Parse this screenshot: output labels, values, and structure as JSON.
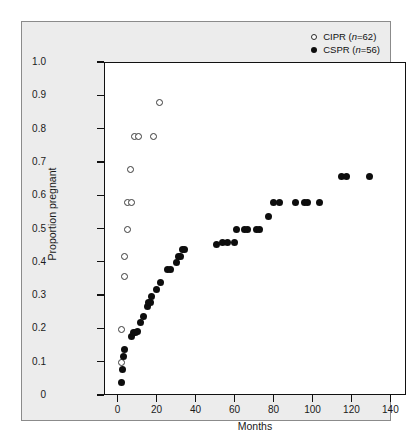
{
  "figure": {
    "background_color": "#ececec",
    "panel_border_color": "#8b8b8b",
    "plot_background": "#ffffff"
  },
  "chart_data": {
    "type": "scatter",
    "title": "",
    "xlabel": "Months",
    "ylabel": "Proportion pregnant",
    "xlim": [
      -7,
      148
    ],
    "ylim": [
      0,
      1.0
    ],
    "xticks": [
      0,
      20,
      40,
      60,
      80,
      100,
      120,
      140
    ],
    "xtick_labels": [
      "0",
      "20",
      "40",
      "60",
      "80",
      "100",
      "120",
      "140"
    ],
    "yticks": [
      0,
      0.1,
      0.2,
      0.3,
      0.4,
      0.5,
      0.6,
      0.7,
      0.8,
      0.9,
      1.0
    ],
    "ytick_labels": [
      "0",
      "0.1",
      "0.2",
      "0.3",
      "0.4",
      "0.5",
      "0.6",
      "0.7",
      "0.8",
      "0.9",
      "1.0"
    ],
    "grid": false,
    "legend_position": "top-right",
    "series": [
      {
        "name": "CIPR",
        "legend_label_main": "CIPR (",
        "legend_label_italic": "n",
        "legend_label_tail": "=62)",
        "n": 62,
        "marker": "open-circle",
        "marker_color": "#ffffff",
        "marker_edge_color": "#3a3a3a",
        "points": [
          {
            "x": 1.5,
            "y": 0.1
          },
          {
            "x": 1.5,
            "y": 0.2
          },
          {
            "x": 3.0,
            "y": 0.36
          },
          {
            "x": 3.0,
            "y": 0.42
          },
          {
            "x": 4.5,
            "y": 0.5
          },
          {
            "x": 4.5,
            "y": 0.58
          },
          {
            "x": 6.5,
            "y": 0.58
          },
          {
            "x": 6.0,
            "y": 0.68
          },
          {
            "x": 8.0,
            "y": 0.78
          },
          {
            "x": 10.0,
            "y": 0.78
          },
          {
            "x": 18.0,
            "y": 0.78
          },
          {
            "x": 21.0,
            "y": 0.88
          }
        ]
      },
      {
        "name": "CSPR",
        "legend_label_main": "CSPR (",
        "legend_label_italic": "n",
        "legend_label_tail": "=56)",
        "n": 56,
        "marker": "filled-circle",
        "marker_color": "#0d0d0d",
        "marker_edge_color": "#0d0d0d",
        "points": [
          {
            "x": 1.5,
            "y": 0.04
          },
          {
            "x": 2.0,
            "y": 0.08
          },
          {
            "x": 2.5,
            "y": 0.12
          },
          {
            "x": 3.0,
            "y": 0.14
          },
          {
            "x": 6.5,
            "y": 0.18
          },
          {
            "x": 7.5,
            "y": 0.19
          },
          {
            "x": 8.5,
            "y": 0.19
          },
          {
            "x": 9.5,
            "y": 0.195
          },
          {
            "x": 11.0,
            "y": 0.22
          },
          {
            "x": 13.0,
            "y": 0.24
          },
          {
            "x": 15.0,
            "y": 0.27
          },
          {
            "x": 15.5,
            "y": 0.28
          },
          {
            "x": 16.5,
            "y": 0.28
          },
          {
            "x": 17.0,
            "y": 0.3
          },
          {
            "x": 19.5,
            "y": 0.32
          },
          {
            "x": 21.5,
            "y": 0.34
          },
          {
            "x": 25.0,
            "y": 0.38
          },
          {
            "x": 26.5,
            "y": 0.38
          },
          {
            "x": 29.5,
            "y": 0.4
          },
          {
            "x": 30.5,
            "y": 0.42
          },
          {
            "x": 32.0,
            "y": 0.42
          },
          {
            "x": 33.0,
            "y": 0.44
          },
          {
            "x": 34.0,
            "y": 0.44
          },
          {
            "x": 50.0,
            "y": 0.455
          },
          {
            "x": 53.5,
            "y": 0.46
          },
          {
            "x": 56.0,
            "y": 0.46
          },
          {
            "x": 59.5,
            "y": 0.46
          },
          {
            "x": 60.5,
            "y": 0.5
          },
          {
            "x": 64.5,
            "y": 0.5
          },
          {
            "x": 66.0,
            "y": 0.5
          },
          {
            "x": 70.5,
            "y": 0.5
          },
          {
            "x": 72.5,
            "y": 0.5
          },
          {
            "x": 77.0,
            "y": 0.54
          },
          {
            "x": 79.5,
            "y": 0.58
          },
          {
            "x": 82.5,
            "y": 0.58
          },
          {
            "x": 91.0,
            "y": 0.58
          },
          {
            "x": 95.5,
            "y": 0.58
          },
          {
            "x": 97.0,
            "y": 0.58
          },
          {
            "x": 103.0,
            "y": 0.58
          },
          {
            "x": 114.5,
            "y": 0.66
          },
          {
            "x": 117.0,
            "y": 0.66
          },
          {
            "x": 129.0,
            "y": 0.66
          }
        ]
      }
    ]
  }
}
